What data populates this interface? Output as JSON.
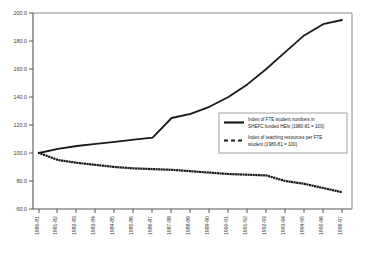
{
  "chart_data": {
    "type": "line",
    "title": "",
    "subtitle": "",
    "xlabel": "",
    "ylabel": "",
    "grid": false,
    "legend_position": "inside-right",
    "ylim": [
      60.0,
      200.0
    ],
    "yticks": [
      "60.0",
      "80.0",
      "100.0",
      "120.0",
      "140.0",
      "160.0",
      "180.0",
      "200.0"
    ],
    "categories": [
      "1980-81",
      "1981-82",
      "1982-83",
      "1983-84",
      "1984-85",
      "1985-86",
      "1986-87",
      "1987-88",
      "1988-89",
      "1989-90",
      "1990-91",
      "1991-92",
      "1992-93",
      "1993-94",
      "1994-95",
      "1995-96",
      "1996-97"
    ],
    "series": [
      {
        "name": "Index of FTE student numbers in SHEFC funded HEIs (1980-81 = 100)",
        "style": "solid",
        "color": "#1a1a1a",
        "values": [
          100.0,
          103.0,
          105.0,
          106.5,
          108.0,
          109.5,
          111.0,
          125.0,
          128.0,
          133.0,
          140.0,
          149.0,
          160.0,
          172.0,
          184.0,
          192.0,
          195.0
        ]
      },
      {
        "name": "Index of teaching resources per FTE student (1980-81 = 100)",
        "style": "dotted",
        "color": "#1a1a1a",
        "values": [
          100.0,
          95.0,
          93.0,
          91.5,
          90.0,
          89.0,
          88.5,
          88.0,
          87.0,
          86.0,
          85.0,
          84.5,
          84.0,
          80.0,
          78.0,
          75.0,
          72.0
        ]
      }
    ],
    "legend": [
      {
        "marker": "solid-line",
        "line1": "Index of FTE student numbers in",
        "line2": "SHEFC funded HEIs (1980-81 = 100)"
      },
      {
        "marker": "dotted-line",
        "line1": "Index of teaching resources per FTE",
        "line2": "student (1980-81 = 100)"
      }
    ]
  },
  "colors": {
    "axis": "#555555",
    "plot_border": "#6a6a6a",
    "series": "#1a1a1a",
    "background": "#ffffff",
    "legend_border": "#8a8a8a"
  }
}
